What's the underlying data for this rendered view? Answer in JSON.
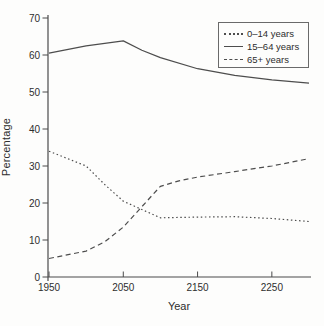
{
  "chart_data": {
    "type": "line",
    "title": "",
    "xlabel": "Year",
    "ylabel": "Percentage",
    "xlim": [
      1950,
      2300
    ],
    "ylim": [
      0,
      70
    ],
    "x_ticks": [
      1950,
      2050,
      2150,
      2250
    ],
    "y_ticks": [
      0,
      10,
      20,
      30,
      40,
      50,
      60,
      70
    ],
    "grid": false,
    "legend_position": "top-right",
    "colors": {
      "line": "#4d4d4d",
      "text": "#2e2e2e",
      "axis": "#4a4a4a",
      "background": "#fdfdfc",
      "legend_border": "#6a6a6a"
    },
    "series": [
      {
        "name": "0–14 years",
        "style": "dotted",
        "x": [
          1950,
          2000,
          2025,
          2050,
          2100,
          2150,
          2200,
          2250,
          2300
        ],
        "y": [
          34,
          30,
          25,
          20.5,
          16,
          16.2,
          16.3,
          15.8,
          15
        ]
      },
      {
        "name": "15–64 years",
        "style": "solid",
        "x": [
          1950,
          2000,
          2050,
          2075,
          2100,
          2150,
          2200,
          2250,
          2300
        ],
        "y": [
          60.5,
          62.5,
          63.8,
          61.3,
          59.3,
          56.3,
          54.5,
          53.3,
          52.4
        ]
      },
      {
        "name": "65+ years",
        "style": "dashed",
        "x": [
          1950,
          2000,
          2025,
          2050,
          2100,
          2125,
          2150,
          2200,
          2250,
          2300
        ],
        "y": [
          5,
          7,
          9.5,
          13.5,
          24.5,
          26,
          27,
          28.5,
          30,
          32
        ]
      }
    ]
  }
}
